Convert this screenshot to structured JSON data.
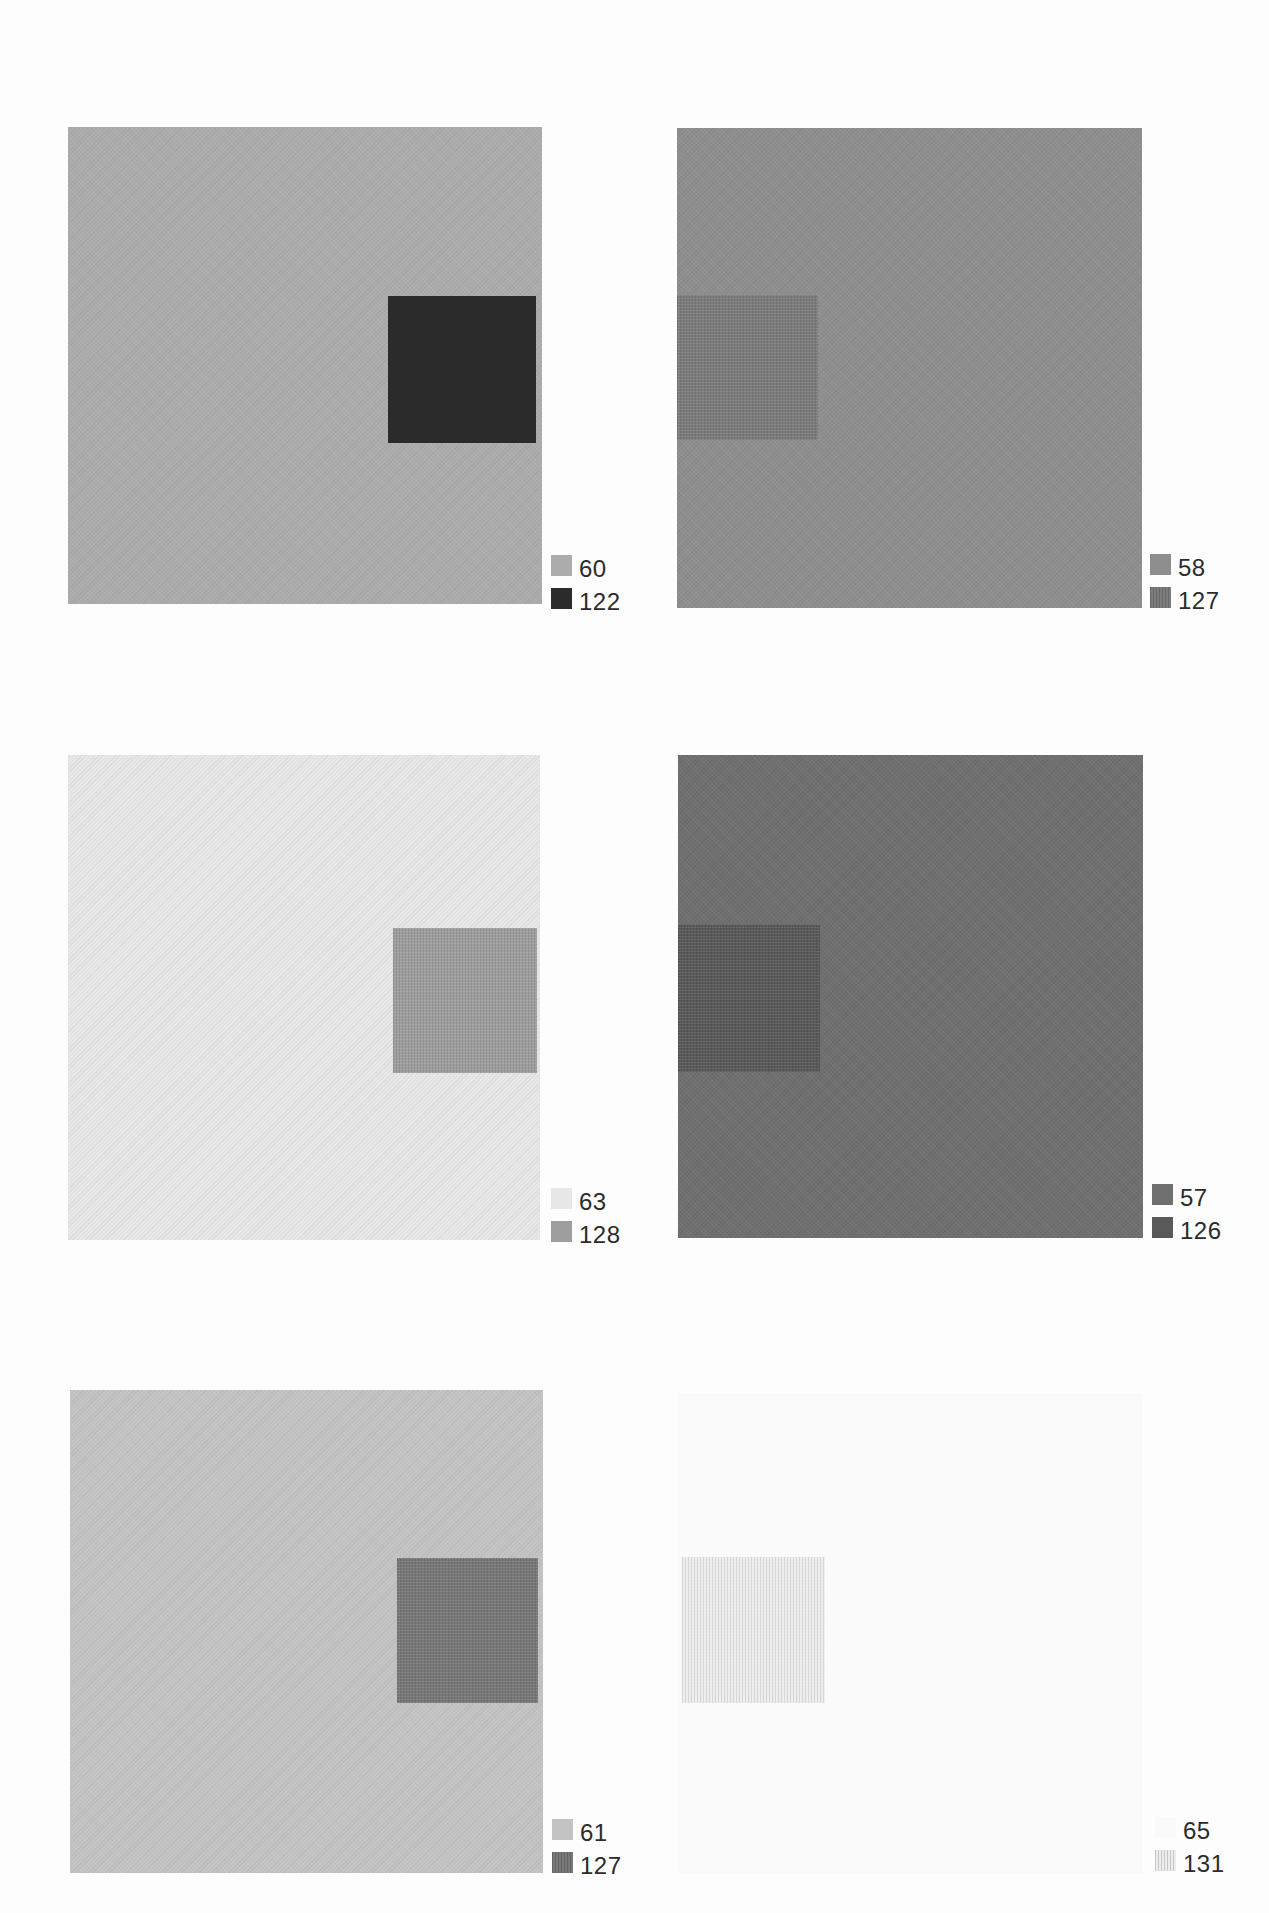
{
  "page": {
    "background_color": "#fdfdfd",
    "text_color": "#2b2b2b"
  },
  "panels": [
    {
      "position": "top-left",
      "surround_value": "60",
      "center_value": "122",
      "surround_color": "#acacac",
      "center_color": "#2b2b2b"
    },
    {
      "position": "top-right",
      "surround_value": "58",
      "center_value": "127",
      "surround_color": "#8e8e8e",
      "center_color": "#7c7c7c"
    },
    {
      "position": "middle-left",
      "surround_value": "63",
      "center_value": "128",
      "surround_color": "#e7e7e7",
      "center_color": "#9e9e9e"
    },
    {
      "position": "middle-right",
      "surround_value": "57",
      "center_value": "126",
      "surround_color": "#6f6f6f",
      "center_color": "#595959"
    },
    {
      "position": "bottom-left",
      "surround_value": "61",
      "center_value": "127",
      "surround_color": "#c3c3c3",
      "center_color": "#787878"
    },
    {
      "position": "bottom-right",
      "surround_value": "65",
      "center_value": "131",
      "surround_color": "#fafafa",
      "center_color": "#ededed"
    }
  ]
}
